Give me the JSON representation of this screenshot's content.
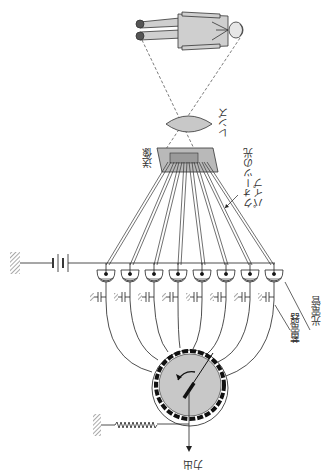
{
  "diagram": {
    "orientation": "rotated 90 degrees; labels read vertically",
    "labels": {
      "lens": "レンズ",
      "image": "送像",
      "light_pipe": "クォーツの光パイプ",
      "photocell": "光電管",
      "capacitor": "蓄電器",
      "output": "出力"
    },
    "components": {
      "subject": "standing person (rendered horizontally)",
      "photocell_count": 8,
      "capacitor_count": 8,
      "fiber_count": 8,
      "battery": "DC battery connected to ground at left",
      "commutator": "circular rotating distributor with contact ring and arrow pointer",
      "spring": "resistor/spring connected to ground",
      "arrow_direction": "output downward"
    },
    "colors": {
      "line": "#222222",
      "fill_gray": "#c8c8c8",
      "dark": "#111111",
      "background": "#ffffff"
    }
  }
}
